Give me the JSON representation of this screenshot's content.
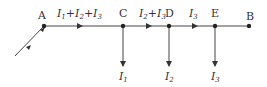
{
  "diagram": {
    "type": "current-divider-circuit",
    "nodes": {
      "A": {
        "label": "A"
      },
      "C": {
        "label": "C"
      },
      "D": {
        "label": "D"
      },
      "E": {
        "label": "E"
      },
      "B": {
        "label": "B"
      }
    },
    "segments": {
      "AC": {
        "current": "I1+I2+I3",
        "parts": [
          {
            "sym": "I",
            "sub": "1"
          },
          {
            "op": "+"
          },
          {
            "sym": "I",
            "sub": "2"
          },
          {
            "op": "+"
          },
          {
            "sym": "I",
            "sub": "3"
          }
        ]
      },
      "CD": {
        "current": "I2+I3",
        "parts": [
          {
            "sym": "I",
            "sub": "2"
          },
          {
            "op": "+"
          },
          {
            "sym": "I",
            "sub": "3"
          }
        ]
      },
      "DE": {
        "current": "I3",
        "parts": [
          {
            "sym": "I",
            "sub": "3"
          }
        ]
      }
    },
    "branches": {
      "C": {
        "sym": "I",
        "sub": "1"
      },
      "D": {
        "sym": "I",
        "sub": "2"
      },
      "E": {
        "sym": "I",
        "sub": "3"
      }
    },
    "colors": {
      "line": "#444444",
      "text": "#333333"
    }
  }
}
